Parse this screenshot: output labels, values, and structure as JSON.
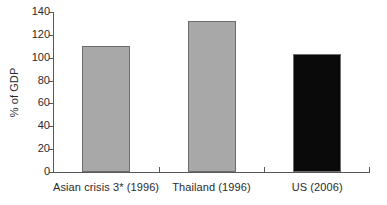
{
  "chart_data": {
    "type": "bar",
    "title": "",
    "xlabel": "",
    "ylabel": "% of GDP",
    "categories": [
      "Asian crisis 3* (1996)",
      "Thailand (1996)",
      "US (2006)"
    ],
    "values": [
      110,
      132,
      103
    ],
    "ylim": [
      0,
      140
    ],
    "yticks": [
      0,
      20,
      40,
      60,
      80,
      100,
      120,
      140
    ],
    "ytick_labels": [
      "0",
      "20",
      "40",
      "60",
      "80",
      "100",
      "120",
      "140"
    ],
    "grid": false,
    "legend": null,
    "bar_colors": [
      "#a8a8a8",
      "#a8a8a8",
      "#0a0a0a"
    ],
    "bar_edge_color": "#6d6d6d",
    "axis_color": "#585858",
    "background": "#ffffff"
  },
  "axis": {
    "y_label": "% of GDP",
    "ticks": [
      {
        "label": "140",
        "value": 140
      },
      {
        "label": "120",
        "value": 120
      },
      {
        "label": "100",
        "value": 100
      },
      {
        "label": "80",
        "value": 80
      },
      {
        "label": "60",
        "value": 60
      },
      {
        "label": "40",
        "value": 40
      },
      {
        "label": "20",
        "value": 20
      },
      {
        "label": "0",
        "value": 0
      }
    ]
  },
  "bars": [
    {
      "label": "Asian crisis 3* (1996)",
      "value": 110,
      "color": "#a8a8a8"
    },
    {
      "label": "Thailand (1996)",
      "value": 132,
      "color": "#a8a8a8"
    },
    {
      "label": "US (2006)",
      "value": 103,
      "color": "#0a0a0a"
    }
  ]
}
